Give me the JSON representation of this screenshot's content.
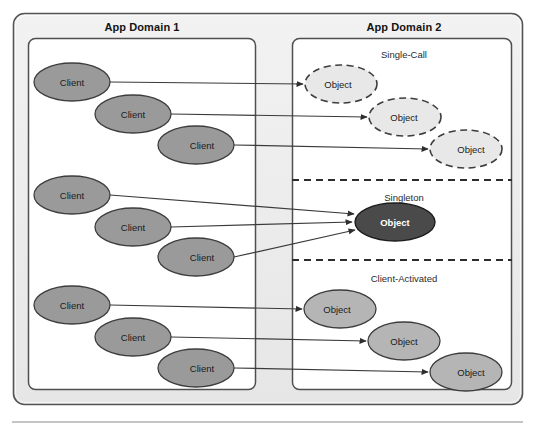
{
  "diagram": {
    "type": "diagram",
    "panels": [
      {
        "id": "app-domain-1",
        "title": "App Domain 1"
      },
      {
        "id": "app-domain-2",
        "title": "App Domain 2"
      }
    ],
    "sections": [
      {
        "id": "single-call",
        "title": "Single-Call"
      },
      {
        "id": "singleton",
        "title": "Singleton"
      },
      {
        "id": "client-activated",
        "title": "Client-Activated"
      }
    ],
    "clients": [
      {
        "label": "Client",
        "group": "single-call",
        "cx": 72,
        "cy": 82,
        "rx": 38,
        "ry": 19
      },
      {
        "label": "Client",
        "group": "single-call",
        "cx": 133,
        "cy": 114,
        "rx": 38,
        "ry": 19
      },
      {
        "label": "Client",
        "group": "single-call",
        "cx": 196,
        "cy": 145,
        "rx": 38,
        "ry": 19
      },
      {
        "label": "Client",
        "group": "singleton",
        "cx": 72,
        "cy": 195,
        "rx": 38,
        "ry": 19
      },
      {
        "label": "Client",
        "group": "singleton",
        "cx": 133,
        "cy": 227,
        "rx": 38,
        "ry": 19
      },
      {
        "label": "Client",
        "group": "singleton",
        "cx": 196,
        "cy": 257,
        "rx": 38,
        "ry": 19
      },
      {
        "label": "Client",
        "group": "client-activated",
        "cx": 72,
        "cy": 305,
        "rx": 38,
        "ry": 19
      },
      {
        "label": "Client",
        "group": "client-activated",
        "cx": 133,
        "cy": 337,
        "rx": 38,
        "ry": 19
      },
      {
        "label": "Client",
        "group": "client-activated",
        "cx": 196,
        "cy": 368,
        "rx": 38,
        "ry": 19
      }
    ],
    "objects": [
      {
        "label": "Object",
        "section": "single-call",
        "style": "dashed-light",
        "cx": 341,
        "cy": 84,
        "rx": 36,
        "ry": 19
      },
      {
        "label": "Object",
        "section": "single-call",
        "style": "dashed-light",
        "cx": 405,
        "cy": 117,
        "rx": 36,
        "ry": 19
      },
      {
        "label": "Object",
        "section": "single-call",
        "style": "dashed-light",
        "cx": 466,
        "cy": 149,
        "rx": 36,
        "ry": 19
      },
      {
        "label": "Object",
        "section": "singleton",
        "style": "solid-dark",
        "cx": 395,
        "cy": 222,
        "rx": 40,
        "ry": 19
      },
      {
        "label": "Object",
        "section": "client-activated",
        "style": "solid-gray",
        "cx": 340,
        "cy": 309,
        "rx": 36,
        "ry": 19
      },
      {
        "label": "Object",
        "section": "client-activated",
        "style": "solid-gray",
        "cx": 404,
        "cy": 341,
        "rx": 36,
        "ry": 19
      },
      {
        "label": "Object",
        "section": "client-activated",
        "style": "solid-gray",
        "cx": 466,
        "cy": 372,
        "rx": 36,
        "ry": 19
      }
    ],
    "connectors": [
      {
        "from": "client-1",
        "to": "object-1",
        "x1": 110,
        "y1": 82,
        "x2": 303,
        "y2": 84
      },
      {
        "from": "client-2",
        "to": "object-2",
        "x1": 171,
        "y1": 114,
        "x2": 367,
        "y2": 117
      },
      {
        "from": "client-3",
        "to": "object-3",
        "x1": 234,
        "y1": 145,
        "x2": 428,
        "y2": 149
      },
      {
        "from": "client-4",
        "to": "object-4",
        "x1": 110,
        "y1": 195,
        "x2": 354,
        "y2": 215
      },
      {
        "from": "client-5",
        "to": "object-4",
        "x1": 171,
        "y1": 227,
        "x2": 352,
        "y2": 222
      },
      {
        "from": "client-6",
        "to": "object-4",
        "x1": 234,
        "y1": 257,
        "x2": 354,
        "y2": 230
      },
      {
        "from": "client-7",
        "to": "object-5",
        "x1": 110,
        "y1": 305,
        "x2": 302,
        "y2": 309
      },
      {
        "from": "client-8",
        "to": "object-6",
        "x1": 171,
        "y1": 337,
        "x2": 366,
        "y2": 341
      },
      {
        "from": "client-9",
        "to": "object-7",
        "x1": 234,
        "y1": 368,
        "x2": 428,
        "y2": 372
      }
    ],
    "dividers": [
      {
        "id": "divider-single-call-singleton",
        "y": 180
      },
      {
        "id": "divider-singleton-client-activated",
        "y": 260
      }
    ]
  },
  "colors": {
    "client_fill": "#9a9a9a",
    "client_stroke": "#3d3d3d",
    "object_light_fill": "#e8e8e8",
    "object_light_stroke": "#3d3d3d",
    "object_gray_fill": "#b5b5b5",
    "object_gray_stroke": "#3d3d3d",
    "object_dark_fill": "#4a4a4a",
    "object_dark_stroke": "#1c1c1c",
    "panel_bg": "#eeeeee",
    "panel_inner_bg": "#ffffff",
    "border": "#555555",
    "connector": "#3a3a3a",
    "footer_rule": "#8a8a8a"
  }
}
